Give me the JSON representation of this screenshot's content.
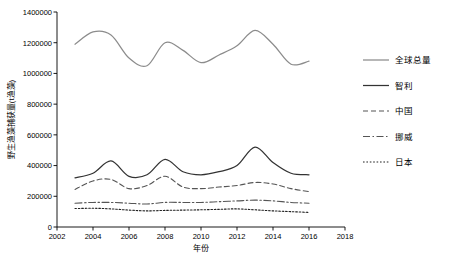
{
  "chart_data": {
    "type": "line",
    "title": "",
    "xlabel": "年份",
    "ylabel": "野生渔藻捕获量(t渔藻)",
    "xlim": [
      2002,
      2018
    ],
    "ylim": [
      0,
      1400000
    ],
    "xticks": [
      "2002",
      "2004",
      "2006",
      "2008",
      "2010",
      "2012",
      "2014",
      "2016",
      "2018"
    ],
    "yticks": [
      "0",
      "200000",
      "400000",
      "600000",
      "800000",
      "1000000",
      "1200000",
      "1400000"
    ],
    "grid": false,
    "legend_position": "right",
    "x": [
      2003,
      2004,
      2005,
      2006,
      2007,
      2008,
      2009,
      2010,
      2011,
      2012,
      2013,
      2014,
      2015,
      2016
    ],
    "series": [
      {
        "name": "全球总量",
        "style": "solid",
        "color": "#8c8c8c",
        "values": [
          1190000,
          1270000,
          1250000,
          1100000,
          1050000,
          1200000,
          1150000,
          1070000,
          1120000,
          1180000,
          1280000,
          1190000,
          1060000,
          1080000
        ]
      },
      {
        "name": "智利",
        "style": "solid",
        "color": "#333333",
        "values": [
          320000,
          350000,
          430000,
          330000,
          340000,
          440000,
          360000,
          340000,
          360000,
          400000,
          520000,
          420000,
          350000,
          340000
        ]
      },
      {
        "name": "中国",
        "style": "dashed",
        "color": "#555555",
        "values": [
          245000,
          300000,
          310000,
          250000,
          270000,
          330000,
          260000,
          250000,
          260000,
          270000,
          290000,
          280000,
          250000,
          230000
        ]
      },
      {
        "name": "挪威",
        "style": "dashdot",
        "color": "#555555",
        "values": [
          155000,
          160000,
          160000,
          155000,
          150000,
          160000,
          160000,
          160000,
          165000,
          170000,
          175000,
          170000,
          160000,
          155000
        ]
      },
      {
        "name": "日本",
        "style": "dotted",
        "color": "#222222",
        "values": [
          120000,
          122000,
          118000,
          110000,
          105000,
          108000,
          110000,
          112000,
          115000,
          118000,
          112000,
          105000,
          100000,
          95000
        ]
      }
    ]
  },
  "legend": {
    "items": [
      {
        "label": "全球总量"
      },
      {
        "label": "智利"
      },
      {
        "label": "中国"
      },
      {
        "label": "挪威"
      },
      {
        "label": "日本"
      }
    ]
  }
}
